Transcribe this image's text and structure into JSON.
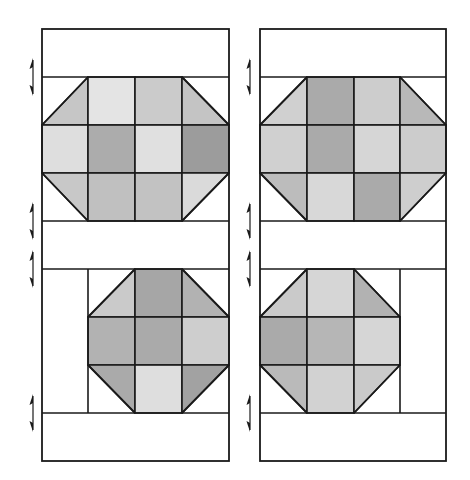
{
  "diagram": {
    "panels": [
      {
        "id": "left",
        "x": 42,
        "y": 29,
        "w": 187,
        "h": 432,
        "cols": [
          42,
          88,
          135,
          182,
          229
        ],
        "rows": [
          29,
          77,
          125,
          173,
          221,
          269,
          317,
          365,
          413,
          461
        ],
        "seam_arrows_y": [
          77,
          221,
          269,
          413
        ],
        "arrow_x": 33,
        "upper_block": {
          "col_start": 0,
          "row_start": 1,
          "ncols": 4,
          "nrows": 3,
          "cells": [
            [
              "tri-br:#c6c6c6",
              "#e4e4e4",
              "#cbcbcb",
              "tri-bl:#c4c4c4"
            ],
            [
              "#dedede",
              "#acacac",
              "#e0e0e0",
              "#9c9c9c"
            ],
            [
              "tri-tr:#c8c8c8",
              "#c0c0c0",
              "#c2c2c2",
              "tri-tl:#dadada"
            ]
          ]
        },
        "lower_block": {
          "col_start": 1,
          "row_start": 5,
          "ncols": 3,
          "nrows": 3,
          "cells": [
            [
              "tri-br:#cacaca",
              "#a6a6a6",
              "tri-bl:#b2b2b2"
            ],
            [
              "#b2b2b2",
              "#aaaaaa",
              "#cecece"
            ],
            [
              "tri-tr:#aaaaaa",
              "#dedede",
              "tri-tl:#a2a2a2"
            ]
          ]
        },
        "extra_lines": [
          {
            "x1": 88,
            "y1": 269,
            "x2": 88,
            "y2": 413
          }
        ]
      },
      {
        "id": "right",
        "x": 260,
        "y": 29,
        "w": 186,
        "h": 432,
        "cols": [
          260,
          307,
          354,
          400,
          446
        ],
        "rows": [
          29,
          77,
          125,
          173,
          221,
          269,
          317,
          365,
          413,
          461
        ],
        "seam_arrows_y": [
          77,
          221,
          269,
          413
        ],
        "arrow_x": 250,
        "upper_block": {
          "col_start": 0,
          "row_start": 1,
          "ncols": 4,
          "nrows": 3,
          "cells": [
            [
              "tri-br:#d0d0d0",
              "#aaaaaa",
              "#cdcdcd",
              "tri-bl:#b8b8b8"
            ],
            [
              "#d0d0d0",
              "#aaaaaa",
              "#d6d6d6",
              "#cccccc"
            ],
            [
              "tri-tr:#bcbcbc",
              "#d8d8d8",
              "#aaaaaa",
              "tri-tl:#cecece"
            ]
          ]
        },
        "lower_block": {
          "col_start": 0,
          "row_start": 5,
          "ncols": 3,
          "nrows": 3,
          "cells": [
            [
              "tri-br:#cacaca",
              "#d6d6d6",
              "tri-bl:#b2b2b2"
            ],
            [
              "#aaaaaa",
              "#b6b6b6",
              "#d6d6d6"
            ],
            [
              "tri-tr:#bababa",
              "#d2d2d2",
              "tri-tl:#cacaca"
            ]
          ]
        },
        "extra_lines": [
          {
            "x1": 400,
            "y1": 269,
            "x2": 400,
            "y2": 413
          }
        ]
      }
    ],
    "colors": {
      "stroke": "#1a1a1a",
      "background": "#ffffff",
      "arrow": "#1a1a1a"
    }
  }
}
